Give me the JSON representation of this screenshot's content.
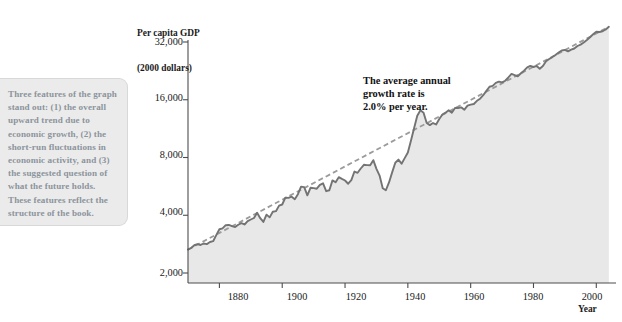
{
  "callout": {
    "text": "Three features of the graph stand out: (1) the overall upward trend due to economic growth, (2) the short-run fluctuations in economic activity, and (3) the suggested question of what the future holds. These features reflect the structure of the book."
  },
  "chart_data": {
    "type": "line",
    "title": "",
    "ylabel": "Per capita GDP\n(2000 dollars)",
    "ylabel_line1": "Per capita GDP",
    "ylabel_line2": "(2000 dollars)",
    "xlabel": "Year",
    "yscale": "log",
    "ylim": [
      2000,
      32000
    ],
    "xlim": [
      1870,
      2005
    ],
    "grid": false,
    "legend": null,
    "yticks": [
      2000,
      4000,
      8000,
      16000,
      32000
    ],
    "ytick_labels": [
      "2,000",
      "4,000",
      "8,000",
      "16,000",
      "32,000"
    ],
    "xticks": [
      1880,
      1900,
      1920,
      1940,
      1960,
      1980,
      2000
    ],
    "xtick_labels": [
      "1880",
      "1900",
      "1920",
      "1940",
      "1960",
      "1980",
      "2000"
    ],
    "annotations": [
      {
        "text": "The average annual\ngrowth rate is\n2.0% per year.",
        "x": 1932,
        "y": 22000
      }
    ],
    "series": [
      {
        "name": "Per capita GDP",
        "style": "solid",
        "color": "#737373",
        "fill": "#e8e8e8",
        "x": [
          1870,
          1871,
          1872,
          1873,
          1874,
          1875,
          1876,
          1877,
          1878,
          1879,
          1880,
          1881,
          1882,
          1883,
          1884,
          1885,
          1886,
          1887,
          1888,
          1889,
          1890,
          1891,
          1892,
          1893,
          1894,
          1895,
          1896,
          1897,
          1898,
          1899,
          1900,
          1901,
          1902,
          1903,
          1904,
          1905,
          1906,
          1907,
          1908,
          1909,
          1910,
          1911,
          1912,
          1913,
          1914,
          1915,
          1916,
          1917,
          1918,
          1919,
          1920,
          1921,
          1922,
          1923,
          1924,
          1925,
          1926,
          1927,
          1928,
          1929,
          1930,
          1931,
          1932,
          1933,
          1934,
          1935,
          1936,
          1937,
          1938,
          1939,
          1940,
          1941,
          1942,
          1943,
          1944,
          1945,
          1946,
          1947,
          1948,
          1949,
          1950,
          1951,
          1952,
          1953,
          1954,
          1955,
          1956,
          1957,
          1958,
          1959,
          1960,
          1961,
          1962,
          1963,
          1964,
          1965,
          1966,
          1967,
          1968,
          1969,
          1970,
          1971,
          1972,
          1973,
          1974,
          1975,
          1976,
          1977,
          1978,
          1979,
          1980,
          1981,
          1982,
          1983,
          1984,
          1985,
          1986,
          1987,
          1988,
          1989,
          1990,
          1991,
          1992,
          1993,
          1994,
          1995,
          1996,
          1997,
          1998,
          1999,
          2000,
          2001,
          2002,
          2003,
          2004
        ],
        "y": [
          2650,
          2700,
          2790,
          2830,
          2800,
          2850,
          2830,
          2900,
          2930,
          3150,
          3380,
          3420,
          3550,
          3560,
          3510,
          3470,
          3570,
          3640,
          3580,
          3730,
          3800,
          3870,
          4120,
          3860,
          3690,
          4030,
          3900,
          4170,
          4200,
          4490,
          4550,
          4940,
          4930,
          5000,
          4850,
          5150,
          5640,
          5610,
          5080,
          5560,
          5540,
          5500,
          5760,
          5870,
          5340,
          5400,
          6080,
          5940,
          6320,
          6190,
          6070,
          5840,
          6100,
          6760,
          6660,
          7010,
          7330,
          7300,
          7290,
          7750,
          6980,
          6440,
          5530,
          5400,
          5930,
          6690,
          7510,
          7800,
          7430,
          7940,
          8500,
          9800,
          11400,
          13200,
          14100,
          13700,
          12100,
          11800,
          12100,
          11900,
          12700,
          13400,
          13700,
          14100,
          13700,
          14500,
          14500,
          14600,
          14200,
          14900,
          15100,
          15200,
          15800,
          16200,
          16900,
          17800,
          18700,
          18900,
          19600,
          19900,
          19700,
          20100,
          20900,
          21800,
          21500,
          21200,
          22000,
          22700,
          23600,
          24000,
          23700,
          24000,
          23200,
          24000,
          25400,
          26100,
          26700,
          27400,
          28200,
          28900,
          29100,
          28600,
          29200,
          29600,
          30500,
          31000,
          31800,
          32800,
          33900,
          35100,
          36200,
          36100,
          36400,
          37200,
          38400
        ]
      },
      {
        "name": "Trend (2.0% per year)",
        "style": "dashed",
        "color": "#9b9b9b",
        "x": [
          1870,
          2004
        ],
        "y": [
          2650,
          38400
        ]
      }
    ]
  }
}
